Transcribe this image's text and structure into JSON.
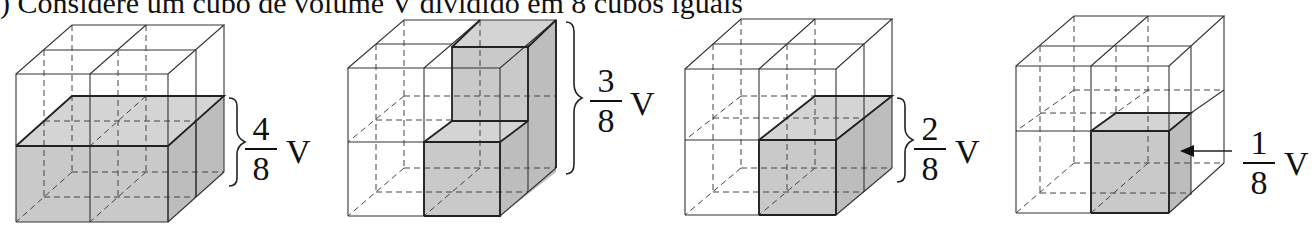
{
  "caption": ") Considere um cubo de volume V dividido em 8 cubos iguais",
  "figures": [
    {
      "id": "cube-half",
      "fraction": {
        "numerator": "4",
        "denominator": "8"
      },
      "unit": "V",
      "shaded": "bottom layer (4 small cubes)",
      "indicator": "brace"
    },
    {
      "id": "cube-three",
      "fraction": {
        "numerator": "3",
        "denominator": "8"
      },
      "unit": "V",
      "shaded": "right-back column + front-right bottom (3 small cubes)",
      "indicator": "brace"
    },
    {
      "id": "cube-two",
      "fraction": {
        "numerator": "2",
        "denominator": "8"
      },
      "unit": "V",
      "shaded": "bottom-right front and back (2 small cubes)",
      "indicator": "brace"
    },
    {
      "id": "cube-one",
      "fraction": {
        "numerator": "1",
        "denominator": "8"
      },
      "unit": "V",
      "shaded": "bottom-right front (1 small cube)",
      "indicator": "arrow"
    }
  ],
  "colors": {
    "line": "#333333",
    "shade": "#c8c8c8",
    "shade_dark": "#b8b8b8",
    "background": "#ffffff"
  }
}
